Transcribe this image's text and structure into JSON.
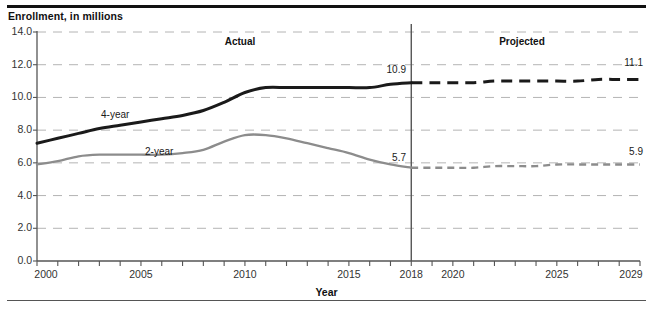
{
  "chart_title": "Enrollment, in millions",
  "axis": {
    "x_title": "Year",
    "y_ticks": [
      "14.0",
      "12.0",
      "10.0",
      "8.0",
      "6.0",
      "4.0",
      "2.0",
      "0.0"
    ],
    "x_ticks": [
      "2000",
      "2005",
      "2010",
      "2015",
      "2018",
      "2020",
      "2025",
      "2029"
    ]
  },
  "regions": {
    "actual_label": "Actual",
    "projected_label": "Projected"
  },
  "series_tags": {
    "four_year": "4-year",
    "two_year": "2-year"
  },
  "point_labels": {
    "four_year_2018": "10.9",
    "four_year_2029": "11.1",
    "two_year_2018": "5.7",
    "two_year_2029": "5.9"
  },
  "colors": {
    "four_year": "#1a1a1a",
    "two_year": "#8c8c8c",
    "grid": "#b4b4b4",
    "axis": "#555555",
    "divider": "#555555"
  },
  "chart_data": {
    "type": "line",
    "title": "Enrollment, in millions",
    "xlabel": "Year",
    "ylabel": "Enrollment, in millions",
    "xlim": [
      2000,
      2029
    ],
    "ylim": [
      0.0,
      14.0
    ],
    "grid": true,
    "legend": "inline-labels",
    "divider_year": 2018,
    "regions": [
      {
        "name": "Actual",
        "x_range": [
          2000,
          2018
        ]
      },
      {
        "name": "Projected",
        "x_range": [
          2018,
          2029
        ]
      }
    ],
    "annotations": [
      {
        "text": "10.9",
        "x": 2018,
        "y": 10.9,
        "series": "4-year"
      },
      {
        "text": "11.1",
        "x": 2029,
        "y": 11.1,
        "series": "4-year"
      },
      {
        "text": "5.7",
        "x": 2018,
        "y": 5.7,
        "series": "2-year"
      },
      {
        "text": "5.9",
        "x": 2029,
        "y": 5.9,
        "series": "2-year"
      }
    ],
    "x": [
      2000,
      2001,
      2002,
      2003,
      2004,
      2005,
      2006,
      2007,
      2008,
      2009,
      2010,
      2011,
      2012,
      2013,
      2014,
      2015,
      2016,
      2017,
      2018,
      2019,
      2020,
      2021,
      2022,
      2023,
      2024,
      2025,
      2026,
      2027,
      2028,
      2029
    ],
    "series": [
      {
        "name": "4-year",
        "style": "solid-then-dashed",
        "color": "#1a1a1a",
        "values": [
          7.2,
          7.5,
          7.8,
          8.1,
          8.3,
          8.5,
          8.7,
          8.9,
          9.2,
          9.7,
          10.3,
          10.6,
          10.6,
          10.6,
          10.6,
          10.6,
          10.6,
          10.8,
          10.9,
          10.9,
          10.9,
          10.9,
          11.0,
          11.0,
          11.0,
          11.0,
          11.0,
          11.1,
          11.1,
          11.1
        ]
      },
      {
        "name": "2-year",
        "style": "solid-then-dashed",
        "color": "#8c8c8c",
        "values": [
          5.9,
          6.1,
          6.4,
          6.5,
          6.5,
          6.5,
          6.5,
          6.6,
          6.8,
          7.3,
          7.7,
          7.7,
          7.5,
          7.2,
          6.9,
          6.6,
          6.2,
          5.9,
          5.7,
          5.7,
          5.7,
          5.7,
          5.8,
          5.8,
          5.8,
          5.9,
          5.9,
          5.9,
          5.9,
          5.9
        ]
      }
    ]
  }
}
